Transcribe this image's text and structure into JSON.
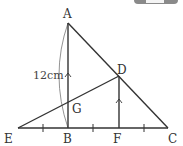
{
  "diagram": {
    "points": {
      "A": {
        "label": "A",
        "x": 68,
        "y": 23
      },
      "B": {
        "label": "B",
        "x": 68,
        "y": 128
      },
      "C": {
        "label": "C",
        "x": 168,
        "y": 128
      },
      "D": {
        "label": "D",
        "x": 119,
        "y": 76
      },
      "E": {
        "label": "E",
        "x": 18,
        "y": 128
      },
      "F": {
        "label": "F",
        "x": 119,
        "y": 128
      },
      "G": {
        "label": "G",
        "x": 68,
        "y": 101
      }
    },
    "segments": [
      "AB",
      "AC",
      "EC",
      "ED",
      "DF"
    ],
    "parallel_marks": [
      "AB",
      "DF"
    ],
    "equal_tick_segments": [
      "EB",
      "BF",
      "FC"
    ],
    "dimension": {
      "segment": "AB",
      "label": "12cm"
    },
    "line_color": "#333333"
  }
}
